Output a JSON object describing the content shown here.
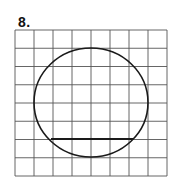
{
  "problem": {
    "label": "8."
  },
  "grid": {
    "columns": 8,
    "rows": 8,
    "x0": 15,
    "y0": 30,
    "x1": 167,
    "y1": 176,
    "line_color": "#555555",
    "line_width": 0.9
  },
  "circle": {
    "cx": 91,
    "cy": 102.5,
    "rx": 57,
    "ry": 54.5,
    "stroke": "#1a1a1a",
    "stroke_width": 1.6
  },
  "chord": {
    "x1": 51,
    "y1": 139,
    "x2": 133,
    "y2": 139,
    "stroke": "#1a1a1a",
    "stroke_width": 2
  }
}
